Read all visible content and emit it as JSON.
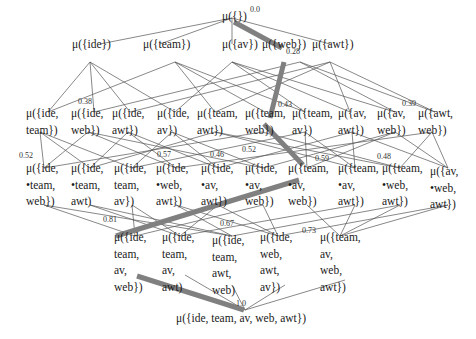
{
  "diagram": {
    "type": "subset lattice",
    "highlight_color": "#808080",
    "edge_color": "#555555",
    "nodes": [
      {
        "id": "n0",
        "label": "μ({})",
        "lines": [
          "μ({})"
        ],
        "x": 222,
        "y": 8
      },
      {
        "id": "n1",
        "lines": [
          "μ({ide})"
        ],
        "x": 72,
        "y": 36
      },
      {
        "id": "n2",
        "lines": [
          "μ({team})"
        ],
        "x": 143,
        "y": 36
      },
      {
        "id": "n3",
        "lines": [
          "μ({av})"
        ],
        "x": 222,
        "y": 36
      },
      {
        "id": "n4",
        "lines": [
          "μ({web})"
        ],
        "x": 262,
        "y": 36
      },
      {
        "id": "n5",
        "lines": [
          "μ({awt})"
        ],
        "x": 312,
        "y": 36
      },
      {
        "id": "n6",
        "lines": [
          "μ({ide,",
          "team})"
        ],
        "x": 26,
        "y": 105
      },
      {
        "id": "n7",
        "lines": [
          "μ({ide,",
          "web})"
        ],
        "x": 71,
        "y": 105
      },
      {
        "id": "n8",
        "lines": [
          "μ({ide,",
          "awt})"
        ],
        "x": 112,
        "y": 105
      },
      {
        "id": "n9",
        "lines": [
          "μ({ide,",
          "av})"
        ],
        "x": 157,
        "y": 105
      },
      {
        "id": "n10",
        "lines": [
          "μ({team,",
          "awt})"
        ],
        "x": 197,
        "y": 105
      },
      {
        "id": "n11",
        "lines": [
          "μ({team,",
          "web})"
        ],
        "x": 245,
        "y": 105
      },
      {
        "id": "n12",
        "lines": [
          "μ({team,",
          "av})"
        ],
        "x": 292,
        "y": 105
      },
      {
        "id": "n13",
        "lines": [
          "μ({av,",
          "awt})"
        ],
        "x": 338,
        "y": 105
      },
      {
        "id": "n14",
        "lines": [
          "μ({av,",
          "web})"
        ],
        "x": 377,
        "y": 105
      },
      {
        "id": "n15",
        "lines": [
          "μ({awt,",
          "web})"
        ],
        "x": 418,
        "y": 105
      },
      {
        "id": "n16",
        "lines": [
          "μ({ide,",
          "•team,",
          "web})"
        ],
        "x": 26,
        "y": 160
      },
      {
        "id": "n17",
        "lines": [
          "μ({ide,",
          "•team,",
          "awt)"
        ],
        "x": 71,
        "y": 160
      },
      {
        "id": "n18",
        "lines": [
          "μ({ide,",
          "team,",
          "av})"
        ],
        "x": 114,
        "y": 160
      },
      {
        "id": "n19",
        "lines": [
          "μ({ide,",
          "•web,",
          "awt})"
        ],
        "x": 156,
        "y": 160
      },
      {
        "id": "n20",
        "lines": [
          "μ({ide,",
          "•av,",
          "awt})"
        ],
        "x": 201,
        "y": 160
      },
      {
        "id": "n21",
        "lines": [
          "μ({ide,",
          "•av,",
          "web})"
        ],
        "x": 245,
        "y": 160
      },
      {
        "id": "n22",
        "lines": [
          "μ({team,",
          "•av,",
          "web})"
        ],
        "x": 288,
        "y": 160
      },
      {
        "id": "n23",
        "lines": [
          "μ({team,",
          "•av,",
          "awt})"
        ],
        "x": 338,
        "y": 160
      },
      {
        "id": "n24",
        "lines": [
          "μ({team,",
          "•web,",
          "awt})"
        ],
        "x": 382,
        "y": 160
      },
      {
        "id": "n25",
        "lines": [
          "μ({av,",
          "•web,",
          "awt})"
        ],
        "x": 430,
        "y": 163
      },
      {
        "id": "n26",
        "lines": [
          "μ({ide,",
          "team,",
          "av,",
          "web})"
        ],
        "x": 114,
        "y": 229
      },
      {
        "id": "n27",
        "lines": [
          "μ({ide,",
          "team,",
          "av,",
          "awt)"
        ],
        "x": 162,
        "y": 229
      },
      {
        "id": "n28",
        "lines": [
          "μ({ide,",
          "team,",
          "awt,",
          "web)"
        ],
        "x": 212,
        "y": 232
      },
      {
        "id": "n29",
        "lines": [
          "μ({ide,",
          "web,",
          "awt,",
          "av})"
        ],
        "x": 260,
        "y": 229
      },
      {
        "id": "n30",
        "lines": [
          "μ({team,",
          "av,",
          "web,",
          "awt})"
        ],
        "x": 320,
        "y": 229
      },
      {
        "id": "n31",
        "lines": [
          "μ({ide, team, av, web, awt})"
        ],
        "x": 176,
        "y": 310
      }
    ],
    "scores": [
      {
        "value": "0.0",
        "x": 250,
        "y": 5
      },
      {
        "value": "0.28",
        "x": 286,
        "y": 47
      },
      {
        "value": "0.38",
        "x": 78,
        "y": 97
      },
      {
        "value": "0.43",
        "x": 278,
        "y": 100
      },
      {
        "value": "0.39",
        "x": 402,
        "y": 99
      },
      {
        "value": "0.52",
        "x": 19,
        "y": 151
      },
      {
        "value": "0.57",
        "x": 157,
        "y": 150
      },
      {
        "value": "0.46",
        "x": 210,
        "y": 150
      },
      {
        "value": "0.52",
        "x": 242,
        "y": 145
      },
      {
        "value": "0.59",
        "x": 315,
        "y": 154
      },
      {
        "value": "0.48",
        "x": 377,
        "y": 152
      },
      {
        "value": "0.81",
        "x": 103,
        "y": 215
      },
      {
        "value": "0.67",
        "x": 220,
        "y": 219
      },
      {
        "value": "0.73",
        "x": 302,
        "y": 226
      },
      {
        "value": "1.0",
        "x": 236,
        "y": 299
      }
    ],
    "highlighted_path": [
      "n0",
      "n4",
      "n11",
      "n22",
      "n26",
      "n31"
    ],
    "highlighted_path_scores": [
      "0.0",
      "0.28",
      "0.43",
      "0.59",
      "0.81",
      "1.0"
    ]
  }
}
